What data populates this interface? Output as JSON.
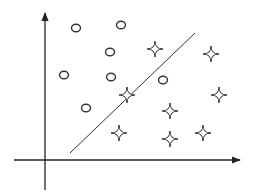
{
  "diagram": {
    "title": "",
    "colors": {
      "stroke": "#333333",
      "axis": "#222222",
      "background": "#ffffff"
    },
    "axes": {
      "y_axis": {
        "x": 45,
        "y_bottom": 190,
        "y_top": 9
      },
      "x_axis": {
        "y": 160,
        "x_left": 14,
        "x_right": 244
      }
    },
    "decision_boundary": {
      "x1": 70,
      "y1": 153,
      "x2": 195,
      "y2": 33
    },
    "classes": [
      {
        "name": "circle",
        "marker": "circle-icon",
        "points": [
          [
            76,
            28
          ],
          [
            121,
            25
          ],
          [
            110,
            52
          ],
          [
            64,
            75
          ],
          [
            111,
            77
          ],
          [
            163,
            80
          ],
          [
            86,
            108
          ]
        ]
      },
      {
        "name": "star",
        "marker": "star-icon",
        "points": [
          [
            155,
            49
          ],
          [
            211,
            54
          ],
          [
            127,
            95
          ],
          [
            219,
            95
          ],
          [
            170,
            111
          ],
          [
            119,
            133
          ],
          [
            170,
            139
          ],
          [
            203,
            133
          ]
        ]
      }
    ]
  }
}
